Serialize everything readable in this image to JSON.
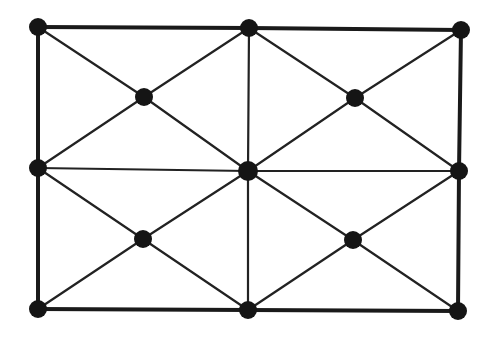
{
  "diagram": {
    "type": "graph",
    "colors": {
      "background": "#ffffff",
      "edge": "#1a1a1a",
      "node": "#151515"
    },
    "nodes": [
      {
        "id": "n1",
        "x": 38,
        "y": 27,
        "r": 9
      },
      {
        "id": "n2",
        "x": 249,
        "y": 28,
        "r": 9
      },
      {
        "id": "n3",
        "x": 461,
        "y": 30,
        "r": 9
      },
      {
        "id": "n4",
        "x": 38,
        "y": 168,
        "r": 9
      },
      {
        "id": "n5",
        "x": 248,
        "y": 171,
        "r": 10
      },
      {
        "id": "n6",
        "x": 459,
        "y": 171,
        "r": 9
      },
      {
        "id": "n7",
        "x": 38,
        "y": 309,
        "r": 9
      },
      {
        "id": "n8",
        "x": 248,
        "y": 310,
        "r": 9
      },
      {
        "id": "n9",
        "x": 458,
        "y": 311,
        "r": 9
      },
      {
        "id": "c1",
        "x": 144,
        "y": 97,
        "r": 9
      },
      {
        "id": "c2",
        "x": 355,
        "y": 98,
        "r": 9
      },
      {
        "id": "c3",
        "x": 143,
        "y": 239,
        "r": 9
      },
      {
        "id": "c4",
        "x": 353,
        "y": 240,
        "r": 9
      }
    ],
    "edges": [
      {
        "from": "n1",
        "to": "n2",
        "kind": "outer"
      },
      {
        "from": "n2",
        "to": "n3",
        "kind": "outer"
      },
      {
        "from": "n7",
        "to": "n8",
        "kind": "outer"
      },
      {
        "from": "n8",
        "to": "n9",
        "kind": "outer"
      },
      {
        "from": "n1",
        "to": "n4",
        "kind": "outer"
      },
      {
        "from": "n4",
        "to": "n7",
        "kind": "outer"
      },
      {
        "from": "n3",
        "to": "n6",
        "kind": "outer"
      },
      {
        "from": "n6",
        "to": "n9",
        "kind": "outer"
      },
      {
        "from": "n4",
        "to": "n5",
        "kind": "inner"
      },
      {
        "from": "n5",
        "to": "n6",
        "kind": "inner"
      },
      {
        "from": "n2",
        "to": "n5",
        "kind": "inner"
      },
      {
        "from": "n5",
        "to": "n8",
        "kind": "inner"
      },
      {
        "from": "n1",
        "to": "c1",
        "kind": "inner"
      },
      {
        "from": "c1",
        "to": "n5",
        "kind": "inner"
      },
      {
        "from": "n2",
        "to": "c1",
        "kind": "inner"
      },
      {
        "from": "c1",
        "to": "n4",
        "kind": "inner"
      },
      {
        "from": "n2",
        "to": "c2",
        "kind": "inner"
      },
      {
        "from": "c2",
        "to": "n6",
        "kind": "inner"
      },
      {
        "from": "n3",
        "to": "c2",
        "kind": "inner"
      },
      {
        "from": "c2",
        "to": "n5",
        "kind": "inner"
      },
      {
        "from": "n4",
        "to": "c3",
        "kind": "inner"
      },
      {
        "from": "c3",
        "to": "n8",
        "kind": "inner"
      },
      {
        "from": "n5",
        "to": "c3",
        "kind": "inner"
      },
      {
        "from": "c3",
        "to": "n7",
        "kind": "inner"
      },
      {
        "from": "n5",
        "to": "c4",
        "kind": "inner"
      },
      {
        "from": "c4",
        "to": "n9",
        "kind": "inner"
      },
      {
        "from": "n6",
        "to": "c4",
        "kind": "inner"
      },
      {
        "from": "c4",
        "to": "n8",
        "kind": "inner"
      }
    ]
  }
}
